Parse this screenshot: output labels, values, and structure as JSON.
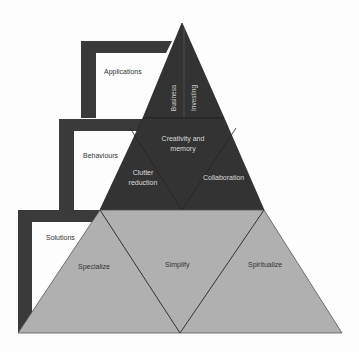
{
  "diagram": {
    "type": "tiered pyramid with side brackets",
    "brackets": [
      {
        "label": "Applications"
      },
      {
        "label": "Behaviours"
      },
      {
        "label": "Solutions"
      }
    ],
    "pyramid": {
      "top_tier": {
        "left": "Business",
        "right": "Investing"
      },
      "middle_tier": {
        "center": "Creativity and memory",
        "left": "Clutter reduction",
        "right": "Collaboration"
      },
      "bottom_tier": {
        "left": "Specialize",
        "center": "Simplify",
        "right": "Spiritualize"
      }
    },
    "colors": {
      "dark": "#333333",
      "light": "#b0b0b0",
      "bracket": "#3a3a3a"
    }
  }
}
